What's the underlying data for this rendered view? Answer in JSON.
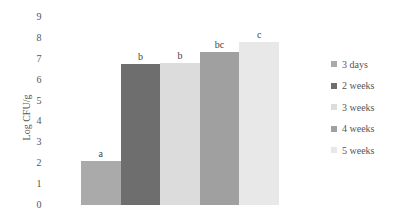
{
  "chart_data": {
    "type": "bar",
    "title": "",
    "xlabel": "",
    "ylabel": "Log CFU/g",
    "ylim": [
      0,
      9
    ],
    "yticks": [
      "0",
      "1",
      "2",
      "3",
      "4",
      "5",
      "6",
      "7",
      "8",
      "9"
    ],
    "grid": false,
    "legend_position": "right",
    "categories": [
      "3 days",
      "2 weeks",
      "3 weeks",
      "4 weeks",
      "5 weeks"
    ],
    "values": [
      2.1,
      6.75,
      6.8,
      7.3,
      7.8
    ],
    "significance_labels": [
      "a",
      "b",
      "b",
      "bc",
      "c"
    ],
    "colors": [
      "#aaaaaa",
      "#6e6e6e",
      "#dcdcdc",
      "#a0a0a0",
      "#e8e8e8"
    ],
    "legend": [
      "3 days",
      "2 weeks",
      "3 weeks",
      "4 weeks",
      "5 weeks"
    ]
  }
}
